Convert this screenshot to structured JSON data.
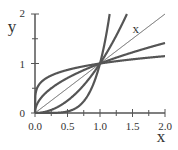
{
  "chart_data": {
    "type": "line",
    "title": "",
    "xlabel": "x",
    "ylabel": "y",
    "xlim": [
      0,
      2
    ],
    "ylim": [
      0,
      2
    ],
    "grid": false,
    "x_ticks": [
      "0.0",
      "0.5",
      "1.0",
      "1.5",
      "2.0"
    ],
    "y_ticks": [
      "0",
      "1",
      "2"
    ],
    "series": [
      {
        "name": "x^(1/5)",
        "power": 0.2,
        "width": 2.2
      },
      {
        "name": "x^(1/2)",
        "power": 0.5,
        "width": 2.2
      },
      {
        "name": "x",
        "power": 1,
        "width": 1,
        "label": "x"
      },
      {
        "name": "x^2",
        "power": 2,
        "width": 2.2
      },
      {
        "name": "x^5",
        "power": 5,
        "width": 2.2
      }
    ],
    "annotations": [
      {
        "text": "x",
        "x": 1.55,
        "y": 1.62
      }
    ],
    "line_color": "#555555"
  }
}
